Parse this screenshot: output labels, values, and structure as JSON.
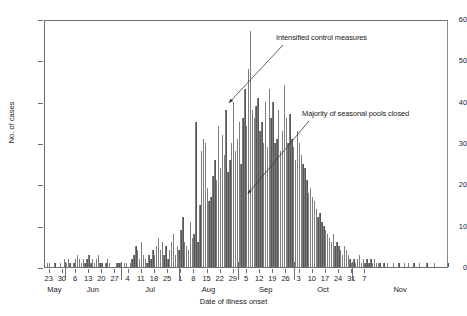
{
  "chart_data": {
    "type": "bar",
    "title": "",
    "xlabel": "Date of illness onset",
    "ylabel": "No. of cases",
    "ylim": [
      0,
      60
    ],
    "ytick_values": [
      0,
      10,
      20,
      30,
      40,
      50,
      60
    ],
    "grid": false,
    "legend": null,
    "bar_color": "#555555",
    "x_description": "Daily case counts by date of illness onset, 21 May through 10 November",
    "xtick_labels": [
      "23",
      "30",
      "6",
      "13",
      "20",
      "27",
      "4",
      "11",
      "18",
      "25",
      "1",
      "8",
      "15",
      "22",
      "29",
      "5",
      "12",
      "19",
      "26",
      "3",
      "10",
      "17",
      "24",
      "31",
      "7"
    ],
    "month_labels": [
      "May",
      "Jun",
      "Jul",
      "Aug",
      "Sep",
      "Oct",
      "Nov"
    ],
    "annotations": [
      {
        "text": "Intensified control measures",
        "points_to_day": 98,
        "points_to_value": 40
      },
      {
        "text": "Majority of seasonal pools closed",
        "points_to_day": 108,
        "points_to_value": 18
      }
    ],
    "start_date": "May 21",
    "n_days": 174,
    "values": [
      0,
      1,
      1,
      0,
      0,
      1,
      0,
      0,
      1,
      0,
      2,
      1,
      2,
      1,
      0,
      1,
      2,
      3,
      2,
      1,
      2,
      1,
      2,
      3,
      1,
      2,
      1,
      2,
      3,
      1,
      1,
      0,
      1,
      2,
      1,
      0,
      0,
      0,
      1,
      1,
      1,
      0,
      1,
      1,
      0,
      1,
      2,
      3,
      5,
      4,
      2,
      6,
      3,
      2,
      1,
      3,
      2,
      4,
      3,
      5,
      7,
      4,
      6,
      3,
      5,
      2,
      4,
      6,
      8,
      3,
      5,
      4,
      9,
      12,
      6,
      5,
      4,
      11,
      7,
      8,
      35,
      6,
      15,
      28,
      31,
      30,
      19,
      16,
      17,
      22,
      26,
      21,
      34,
      24,
      32,
      27,
      38,
      23,
      26,
      30,
      40,
      28,
      31,
      35,
      25,
      36,
      43,
      34,
      48,
      57,
      38,
      36,
      39,
      41,
      33,
      35,
      30,
      40,
      29,
      43,
      36,
      40,
      30,
      31,
      38,
      28,
      33,
      44,
      36,
      30,
      37,
      31,
      29,
      26,
      33,
      30,
      27,
      25,
      24,
      21,
      18,
      19,
      17,
      16,
      14,
      12,
      13,
      11,
      10,
      9,
      8,
      7,
      6,
      8,
      5,
      6,
      5,
      4,
      3,
      5,
      4,
      3,
      2,
      1,
      2,
      1,
      2,
      3,
      1,
      2,
      1,
      2,
      1,
      2,
      1,
      2,
      1,
      1,
      1,
      0,
      1,
      0,
      1,
      0,
      0,
      1,
      0,
      0,
      1,
      0,
      0,
      1,
      0,
      1,
      0,
      0,
      1,
      0,
      0,
      1,
      0,
      0,
      0,
      1,
      0,
      0,
      0,
      1,
      0,
      0,
      0,
      0,
      0,
      0,
      1
    ]
  }
}
